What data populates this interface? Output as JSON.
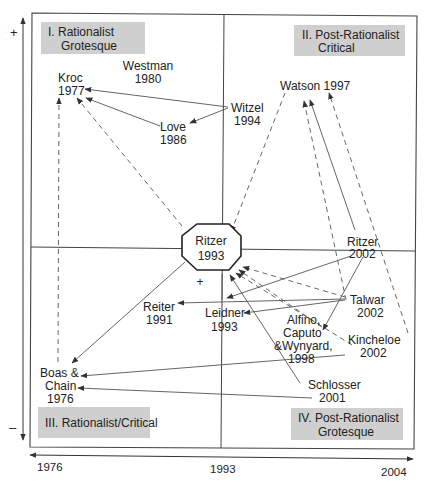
{
  "diagram": {
    "colors": {
      "line": "#555555",
      "frame": "#444444",
      "quadrant_box": "#cfcfcf",
      "text": "#222222"
    },
    "vertical_axis": {
      "top_sign": "+",
      "bottom_sign": "–"
    },
    "horizontal_axis": {
      "ticks": [
        "1976",
        "1993",
        "2004"
      ]
    },
    "quadrants": [
      {
        "id": "q1",
        "lines": [
          "I.  Rationalist",
          "Grotesque"
        ]
      },
      {
        "id": "q2",
        "lines": [
          "II.  Post-Rationalist",
          "Critical"
        ]
      },
      {
        "id": "q3",
        "lines": [
          "III. Rationalist/Critical"
        ]
      },
      {
        "id": "q4",
        "lines": [
          "IV.  Post-Rationalist",
          "Grotesque"
        ]
      }
    ],
    "nodes": [
      {
        "id": "kroc",
        "lines": [
          "Kroc",
          "1977"
        ]
      },
      {
        "id": "westman",
        "lines": [
          "Westman",
          "1980"
        ]
      },
      {
        "id": "witzel",
        "lines": [
          "Witzel",
          "1994"
        ]
      },
      {
        "id": "love",
        "lines": [
          "Love",
          "1986"
        ]
      },
      {
        "id": "watson",
        "lines": [
          "Watson 1997"
        ]
      },
      {
        "id": "ritzer1993",
        "lines": [
          "Ritzer",
          "1993"
        ]
      },
      {
        "id": "ritzer2002",
        "lines": [
          "Ritzer",
          "2002"
        ]
      },
      {
        "id": "reiter",
        "lines": [
          "Reiter",
          "1991"
        ]
      },
      {
        "id": "leidner",
        "lines": [
          "Leidner",
          "1993"
        ]
      },
      {
        "id": "talwar",
        "lines": [
          "Talwar",
          "2002"
        ]
      },
      {
        "id": "alfino",
        "lines": [
          "Alfino,",
          "Caputo",
          "&Wynyard,",
          "1998"
        ]
      },
      {
        "id": "kincheloe",
        "lines": [
          "Kincheloe",
          "2002"
        ]
      },
      {
        "id": "boas",
        "lines": [
          "Boas &",
          "Chain",
          "1976"
        ]
      },
      {
        "id": "schlosser",
        "lines": [
          "Schlosser",
          "2001"
        ]
      }
    ],
    "center_marker": "+",
    "edges": [
      {
        "from": "Witzel 1994",
        "to": "Kroc 1977",
        "style": "solid"
      },
      {
        "from": "Witzel 1994",
        "to": "Love 1986",
        "style": "solid"
      },
      {
        "from": "Love 1986",
        "to": "Kroc 1977",
        "style": "solid"
      },
      {
        "from": "Ritzer 1993",
        "to": "Kroc 1977",
        "style": "dashed"
      },
      {
        "from": "Boas & Chain 1976",
        "to": "Kroc 1977",
        "style": "dashed"
      },
      {
        "from": "Watson 1997",
        "to": "Ritzer 1993",
        "style": "dashed"
      },
      {
        "from": "Ritzer 2002",
        "to": "Watson 1997",
        "style": "solid"
      },
      {
        "from": "Talwar 2002",
        "to": "Watson 1997",
        "style": "dashed"
      },
      {
        "from": "Kincheloe 2002",
        "to": "Watson 1997",
        "style": "dashed"
      },
      {
        "from": "Watson 1997",
        "to": "Alfino, Caputo & Wynyard 1998",
        "style": "solid"
      },
      {
        "from": "Ritzer 1993",
        "to": "Boas & Chain 1976",
        "style": "solid"
      },
      {
        "from": "Ritzer 2002",
        "to": "Leidner 1993",
        "style": "solid"
      },
      {
        "from": "Talwar 2002",
        "to": "Reiter 1991",
        "style": "solid"
      },
      {
        "from": "Talwar 2002",
        "to": "Leidner 1993",
        "style": "solid"
      },
      {
        "from": "Kincheloe 2002",
        "to": "Boas & Chain 1976",
        "style": "solid"
      },
      {
        "from": "Schlosser 2001",
        "to": "Boas & Chain 1976",
        "style": "solid"
      },
      {
        "from": "Talwar 2002",
        "to": "Ritzer 1993",
        "style": "dashed"
      },
      {
        "from": "Alfino, Caputo & Wynyard 1998",
        "to": "Ritzer 1993",
        "style": "dashed"
      },
      {
        "from": "Kincheloe 2002",
        "to": "Ritzer 1993",
        "style": "dashed"
      },
      {
        "from": "Schlosser 2001",
        "to": "Ritzer 1993",
        "style": "solid"
      }
    ]
  }
}
